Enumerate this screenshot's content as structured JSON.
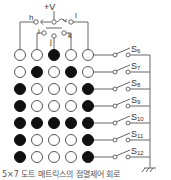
{
  "diagram": {
    "supply_label": "+V",
    "selector_labels": [
      "h",
      "i",
      "j",
      "k",
      "l"
    ],
    "switch_labels": [
      "S6",
      "S7",
      "S8",
      "S9",
      "S10",
      "S11",
      "S12"
    ],
    "ground_symbol": "777",
    "caption": "5×7 도트 매트릭스의 점멸제어 회로",
    "matrix": {
      "columns": 5,
      "rows": 7,
      "character": "A",
      "pattern": [
        [
          0,
          0,
          1,
          0,
          0
        ],
        [
          0,
          1,
          0,
          1,
          0
        ],
        [
          1,
          0,
          0,
          0,
          1
        ],
        [
          1,
          0,
          0,
          0,
          1
        ],
        [
          1,
          1,
          1,
          1,
          1
        ],
        [
          1,
          0,
          0,
          0,
          1
        ],
        [
          1,
          0,
          0,
          0,
          1
        ]
      ]
    },
    "colors": {
      "line": "#666666",
      "lit": "#111111",
      "unlit_fill": "#ffffff",
      "unlit_stroke": "#555555"
    }
  }
}
